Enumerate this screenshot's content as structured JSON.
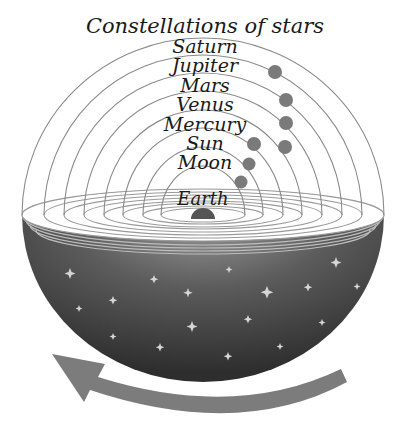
{
  "title": "Constellations of stars",
  "spheres": [
    {
      "name": "Saturn",
      "label_y": 53
    },
    {
      "name": "Jupiter",
      "label_y": 72
    },
    {
      "name": "Mars",
      "label_y": 92
    },
    {
      "name": "Venus",
      "label_y": 111
    },
    {
      "name": "Mercury",
      "label_y": 131
    },
    {
      "name": "Sun",
      "label_y": 150
    },
    {
      "name": "Moon",
      "label_y": 169
    }
  ],
  "center_label": "Earth",
  "colors": {
    "sphere_line": "#8a8a8a",
    "planet": "#7a7a7a",
    "earth": "#555555",
    "bowl_dark": "#3a3a3a",
    "bowl_light": "#8c8c8c",
    "arrow": "#7c7c7c",
    "star": "#cfcfcf"
  },
  "rotation_arrow": "counter-clockwise"
}
